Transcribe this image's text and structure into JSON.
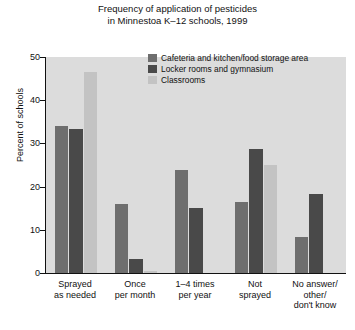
{
  "chart_data": {
    "type": "bar",
    "title": "Frequency of application of pesticides in Minnestoa K–12 schools, 1999",
    "title_lines": [
      "Frequency of application of pesticides",
      "in Minnestoa K–12 schools, 1999"
    ],
    "xlabel": "",
    "ylabel": "Percent of schools",
    "ylim": [
      0,
      50
    ],
    "yticks": [
      0,
      10,
      20,
      30,
      40,
      50
    ],
    "ytick_labels": [
      "0",
      "10",
      "20",
      "30",
      "40",
      "50"
    ],
    "grid": false,
    "legend_position": "upper center inside plot",
    "categories": [
      "Sprayed as needed",
      "Once per month",
      "1–4 times per year",
      "Not sprayed",
      "No answer/ other/ don't know"
    ],
    "category_lines": [
      [
        "Sprayed",
        "as needed"
      ],
      [
        "Once",
        "per month"
      ],
      [
        "1–4 times",
        "per year"
      ],
      [
        "Not",
        "sprayed"
      ],
      [
        "No answer/",
        "other/",
        "don't know"
      ]
    ],
    "series": [
      {
        "name": "Cafeteria and kitchen/food storage area",
        "color": "#6e6e6e",
        "values": [
          34,
          16,
          23.8,
          16.5,
          8.3
        ]
      },
      {
        "name": "Locker rooms and gymnasium",
        "color": "#494949",
        "values": [
          33.3,
          3.3,
          15,
          28.8,
          18.2
        ]
      },
      {
        "name": "Classrooms",
        "color": "#c3c3c3",
        "values": [
          46.5,
          0.5,
          0,
          25,
          0
        ]
      }
    ]
  },
  "colors": {
    "page_background": "#ffffff",
    "plot_background": "#dcdcdc",
    "axis": "#111111",
    "series_1": "#6e6e6e",
    "series_2": "#494949",
    "series_3": "#c3c3c3"
  }
}
